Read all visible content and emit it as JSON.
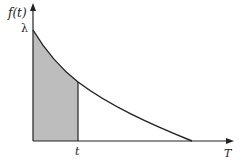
{
  "diagram": {
    "y_axis_label": "f(t)",
    "y_intercept_label": "λ",
    "x_axis_label": "T",
    "marker_label": "t",
    "colors": {
      "axis": "#222222",
      "curve": "#222222",
      "shade": "#bdbdbd",
      "background": "#ffffff"
    }
  }
}
